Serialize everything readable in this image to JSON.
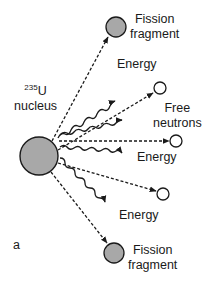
{
  "diagram": {
    "panel_label": "a",
    "colors": {
      "fill_gray": "#a8a8a8",
      "stroke": "#1a1a1a",
      "neutron_fill": "#ffffff",
      "background": "#ffffff"
    },
    "nucleus": {
      "label_sup": "235",
      "label_symbol": "U",
      "label_line2": "nucleus"
    },
    "labels": {
      "fission_fragment_top_line1": "Fission",
      "fission_fragment_top_line2": "fragment",
      "energy_top": "Energy",
      "free_neutrons_line1": "Free",
      "free_neutrons_line2": "neutrons",
      "energy_middle": "Energy",
      "energy_bottom": "Energy",
      "fission_fragment_bottom_line1": "Fission",
      "fission_fragment_bottom_line2": "fragment"
    },
    "arrows": [
      {
        "type": "dashed",
        "target": "fission-fragment-top"
      },
      {
        "type": "wavy",
        "target": "energy-top"
      },
      {
        "type": "dashed",
        "target": "free-neutron-1"
      },
      {
        "type": "wavy",
        "target": "energy-middle"
      },
      {
        "type": "dashed",
        "target": "free-neutron-2"
      },
      {
        "type": "dashed",
        "target": "free-neutron-3"
      },
      {
        "type": "wavy",
        "target": "energy-bottom"
      },
      {
        "type": "dashed",
        "target": "fission-fragment-bottom"
      }
    ]
  }
}
